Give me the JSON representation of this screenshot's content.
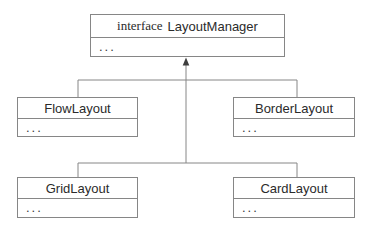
{
  "diagram": {
    "type": "uml-class-diagram",
    "interface_box": {
      "stereotype": "interface",
      "name": "LayoutManager",
      "members": "..."
    },
    "classes": [
      {
        "name": "FlowLayout",
        "members": "..."
      },
      {
        "name": "BorderLayout",
        "members": "..."
      },
      {
        "name": "GridLayout",
        "members": "..."
      },
      {
        "name": "CardLayout",
        "members": "..."
      }
    ],
    "relationship": "arrow-points-to-interface",
    "colors": {
      "background": "#ffffff",
      "box_border": "#868686",
      "connector_line": "#868686",
      "text": "#2b2b2b",
      "arrowhead": "#3d3d3d"
    }
  }
}
